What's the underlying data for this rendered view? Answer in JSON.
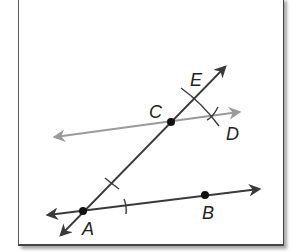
{
  "diagram": {
    "type": "geometric-construction",
    "colors": {
      "line": "#3a3a3a",
      "parallel_line": "#9a9a9a",
      "point": "#111111",
      "frame": "#444444"
    },
    "points": [
      {
        "label": "A",
        "x": 83,
        "y": 211
      },
      {
        "label": "B",
        "x": 205,
        "y": 195
      },
      {
        "label": "C",
        "x": 171,
        "y": 122
      },
      {
        "label": "D",
        "x": 213,
        "y": 116
      },
      {
        "label": "E",
        "x": 194,
        "y": 98
      }
    ],
    "labels": {
      "A": "A",
      "B": "B",
      "C": "C",
      "D": "D",
      "E": "E"
    },
    "lines": [
      {
        "name": "line-AB",
        "through": [
          "A",
          "B"
        ],
        "style": "dark",
        "arrows": "both"
      },
      {
        "name": "line-AE",
        "through": [
          "A",
          "C",
          "E"
        ],
        "style": "dark",
        "arrows": "both"
      },
      {
        "name": "line-CD",
        "through": [
          "C",
          "D"
        ],
        "style": "gray",
        "arrows": "both"
      }
    ],
    "construction_marks": [
      {
        "type": "arc",
        "near": "A",
        "on": "line-AE"
      },
      {
        "type": "arc",
        "near": "A",
        "on": "line-AB"
      },
      {
        "type": "arc",
        "near": "E",
        "crosses": "line-AE"
      },
      {
        "type": "arc",
        "near": "D",
        "crosses": "line-CD"
      }
    ]
  }
}
